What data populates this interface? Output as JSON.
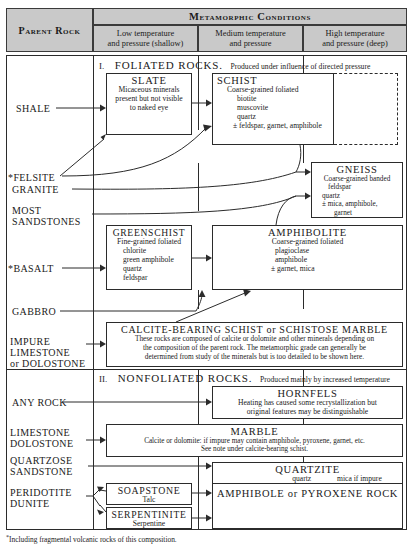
{
  "header": {
    "parent_rock": "Parent Rock",
    "metamorphic_conditions": "Metamorphic Conditions",
    "col_low_l1": "Low temperature",
    "col_low_l2": "and pressure (shallow)",
    "col_med_l1": "Medium temperature",
    "col_med_l2": "and pressure",
    "col_high_l1": "High temperature",
    "col_high_l2": "and pressure (deep)"
  },
  "sections": {
    "foliated_num": "I.",
    "foliated_title": "FOLIATED ROCKS.",
    "foliated_tail": "Produced under influence of directed pressure",
    "nonfoliated_num": "II.",
    "nonfoliated_title": "NONFOLIATED ROCKS.",
    "nonfoliated_tail": "Produced mainly by increased temperature"
  },
  "parent_rocks": {
    "shale": "SHALE",
    "felsite": "*FELSITE",
    "granite": "GRANITE",
    "most": "MOST",
    "sandstones": "SANDSTONES",
    "basalt": "*BASALT",
    "gabbro": "GABBRO",
    "impure": "IMPURE",
    "limestone": "LIMESTONE",
    "or_dolostone": "or DOLOSTONE",
    "any_rock": "ANY ROCK",
    "limestone2": "LIMESTONE",
    "dolostone2": "DOLOSTONE",
    "quartzose": "QUARTZOSE",
    "sandstone2": "SANDSTONE",
    "peridotite": "PERIDOTITE",
    "dunite": "DUNITE"
  },
  "boxes": {
    "slate": {
      "name": "SLATE",
      "l1": "Micaceous minerals",
      "l2": "present but not visible",
      "l3": "to naked eye"
    },
    "schist": {
      "name": "SCHIST",
      "l1": "Coarse-grained foliated",
      "l2": "biotite",
      "l3": "muscovite",
      "l4": "quartz",
      "l5": "± feldspar, garnet, amphibole"
    },
    "gneiss": {
      "name": "GNEISS",
      "l1": "Coarse-grained banded",
      "l2": "feldspar",
      "l3": "quartz",
      "l4": "± mica, amphibole,",
      "l5": "garnet"
    },
    "greenschist": {
      "name": "GREENSCHIST",
      "l1": "Fine-grained foliated",
      "l2": "chlorite",
      "l3": "green amphibole",
      "l4": "quartz",
      "l5": "feldspar"
    },
    "amphibolite": {
      "name": "AMPHIBOLITE",
      "l1": "Coarse-grained foliated",
      "l2": "plagioclase",
      "l3": "amphibole",
      "l4": "± garnet, mica"
    },
    "calcite": {
      "name": "CALCITE-BEARING SCHIST or SCHISTOSE MARBLE",
      "l1": "These rocks are composed of calcite or dolomite and other minerals depending on",
      "l2": "the composition of the parent rock. The metamorphic grade can generally be",
      "l3": "determined from study of the minerals but is too detailed to be shown here."
    },
    "hornfels": {
      "name": "HORNFELS",
      "l1": "Heating has caused some recrystallization but",
      "l2": "original features may be distinguishable"
    },
    "marble": {
      "name": "MARBLE",
      "l1": "Calcite or dolomite: if impure may contain amphibole, pyroxene, garnet, etc.",
      "l2": "See note under calcite-bearing schist."
    },
    "quartzite": {
      "name": "QUARTZITE",
      "l1": "quartz",
      "l2": "mica if impure"
    },
    "soapstone": {
      "name": "SOAPSTONE",
      "l1": "Talc"
    },
    "serpentinite": {
      "name": "SERPENTINITE",
      "l1": "Serpentine"
    },
    "amph_pyx": {
      "name": "AMPHIBOLE or PYROXENE ROCK"
    }
  },
  "footnote": {
    "marker": "*",
    "text": "Including fragmental volcanic rocks of this composition."
  },
  "colors": {
    "header_fill": "#c9c9c9",
    "rule": "#2b2b2b",
    "page": "#ffffff"
  }
}
